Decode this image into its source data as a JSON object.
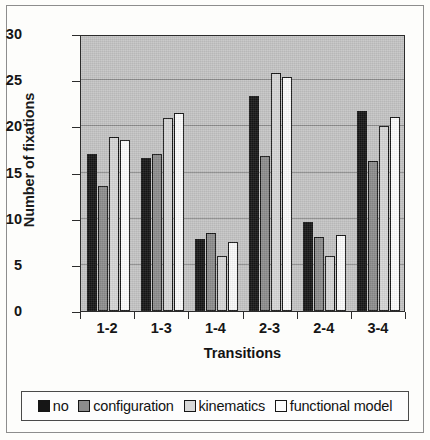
{
  "chart_data": {
    "type": "bar",
    "title": "",
    "subtitle": "",
    "xlabel": "Transitions",
    "ylabel": "Number of fixations",
    "categories": [
      "1-2",
      "1-3",
      "1-4",
      "2-3",
      "2-4",
      "3-4"
    ],
    "series": [
      {
        "name": "no",
        "color": "#161616",
        "values": [
          17.0,
          16.6,
          7.8,
          23.3,
          9.6,
          21.7
        ]
      },
      {
        "name": "configuration",
        "color": "#8c8c8c",
        "values": [
          13.5,
          17.0,
          8.5,
          16.8,
          8.0,
          16.2
        ]
      },
      {
        "name": "kinematics",
        "color": "#d6d6d6",
        "values": [
          18.9,
          20.9,
          6.0,
          25.8,
          6.0,
          20.0
        ]
      },
      {
        "name": "functional model",
        "color": "#fbfbfb",
        "values": [
          18.5,
          21.4,
          7.5,
          25.3,
          8.2,
          21.0
        ]
      }
    ],
    "ylim": [
      0,
      30
    ],
    "yticks": [
      0,
      5,
      10,
      15,
      20,
      25,
      30
    ],
    "ytick_labels": [
      "0",
      "5",
      "10",
      "15",
      "20",
      "25",
      "30"
    ],
    "grid": true,
    "grid_axis": "y",
    "legend_position": "bottom",
    "plot_background": "#c4c4c4",
    "figure_background": "#fdfdfb"
  },
  "legend": {
    "items": [
      {
        "label": "no",
        "swatch": "black-square-icon"
      },
      {
        "label": "configuration",
        "swatch": "dark-gray-square-icon"
      },
      {
        "label": "kinematics",
        "swatch": "light-gray-square-icon"
      },
      {
        "label": "functional model",
        "swatch": "white-square-icon"
      }
    ]
  }
}
